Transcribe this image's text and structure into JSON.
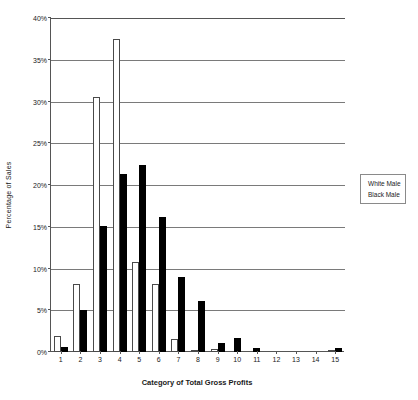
{
  "chart_data": {
    "type": "bar",
    "title": "",
    "subtitle": "",
    "xlabel": "Category of Total Gross Profits",
    "ylabel": "Percentage of Sales",
    "categories": [
      "1",
      "2",
      "3",
      "4",
      "5",
      "6",
      "7",
      "8",
      "9",
      "10",
      "11",
      "12",
      "13",
      "14",
      "15"
    ],
    "series": [
      {
        "name": "White Male",
        "color": "#ffffff",
        "edge_color": "#4a4a4a",
        "values": [
          1.9,
          8.2,
          30.5,
          37.5,
          10.8,
          8.2,
          1.5,
          0.3,
          0.4,
          0.0,
          0.0,
          0.0,
          0.0,
          0.0,
          0.3
        ]
      },
      {
        "name": "Black Male",
        "color": "#000000",
        "edge_color": "#000000",
        "values": [
          0.6,
          5.0,
          15.1,
          21.3,
          22.4,
          16.2,
          9.0,
          6.1,
          1.1,
          1.7,
          0.5,
          0.0,
          0.0,
          0.0,
          0.5
        ]
      }
    ],
    "ylim": [
      0,
      40
    ],
    "yticks": [
      0,
      5,
      10,
      15,
      20,
      25,
      30,
      35,
      40
    ],
    "ytick_labels": [
      "0%",
      "5%",
      "10%",
      "15%",
      "20%",
      "25%",
      "30%",
      "35%",
      "40%"
    ],
    "grid": true,
    "grid_axis": "y",
    "legend_position": "right-outside"
  },
  "legend": {
    "entries": [
      {
        "label": "White Male"
      },
      {
        "label": "Black Male"
      }
    ]
  }
}
